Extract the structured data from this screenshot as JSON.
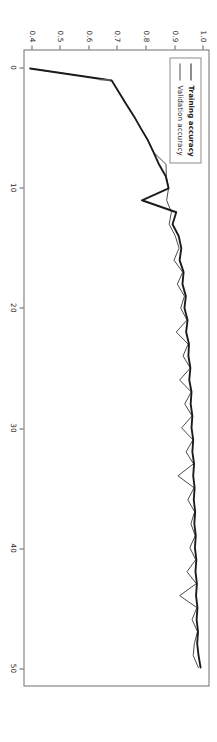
{
  "figure": {
    "rotation_degrees": 90,
    "background_color": "#ffffff",
    "frame_color": "#6f6f6f"
  },
  "legend": {
    "position": "upper left",
    "entries": [
      {
        "label": "Training accuracy",
        "color": "#1b1b1b",
        "style": "thick-solid"
      },
      {
        "label": "Validation accuracy",
        "color": "#4a4a4a",
        "style": "thin-solid"
      }
    ]
  },
  "axes": {
    "xticks": [
      "0",
      "10",
      "20",
      "30",
      "40",
      "50"
    ],
    "yticks": [
      "0.4",
      "0.5",
      "0.6",
      "0.7",
      "0.8",
      "0.9",
      "1.0"
    ]
  },
  "chart_data": {
    "type": "line",
    "title": "",
    "xlabel": "",
    "ylabel": "",
    "xlim": [
      -1.5,
      51.5
    ],
    "ylim": [
      0.37,
      1.02
    ],
    "grid": false,
    "legend_position": "upper left",
    "x": [
      0,
      1,
      2,
      3,
      4,
      5,
      6,
      7,
      8,
      9,
      10,
      11,
      12,
      13,
      14,
      15,
      16,
      17,
      18,
      19,
      20,
      21,
      22,
      23,
      24,
      25,
      26,
      27,
      28,
      29,
      30,
      31,
      32,
      33,
      34,
      35,
      36,
      37,
      38,
      39,
      40,
      41,
      42,
      43,
      44,
      45,
      46,
      47,
      48,
      49,
      50
    ],
    "series": [
      {
        "name": "Training accuracy",
        "color": "#1b1b1b",
        "linewidth": 1.9,
        "values": [
          0.39,
          0.678,
          0.704,
          0.73,
          0.757,
          0.781,
          0.806,
          0.826,
          0.845,
          0.869,
          0.879,
          0.785,
          0.906,
          0.893,
          0.915,
          0.924,
          0.918,
          0.932,
          0.928,
          0.94,
          0.935,
          0.946,
          0.941,
          0.951,
          0.949,
          0.956,
          0.952,
          0.96,
          0.957,
          0.963,
          0.96,
          0.966,
          0.963,
          0.969,
          0.966,
          0.971,
          0.968,
          0.973,
          0.97,
          0.975,
          0.972,
          0.977,
          0.974,
          0.979,
          0.976,
          0.981,
          0.978,
          0.983,
          0.98,
          0.985,
          0.992
        ]
      },
      {
        "name": "Validation accuracy",
        "color": "#4a4a4a",
        "linewidth": 1.0,
        "values": [
          0.39,
          0.678,
          0.704,
          0.73,
          0.757,
          0.781,
          0.806,
          0.826,
          0.87,
          0.871,
          0.879,
          0.872,
          0.889,
          0.881,
          0.903,
          0.916,
          0.898,
          0.929,
          0.91,
          0.935,
          0.922,
          0.944,
          0.906,
          0.948,
          0.93,
          0.956,
          0.918,
          0.959,
          0.936,
          0.962,
          0.925,
          0.965,
          0.941,
          0.967,
          0.912,
          0.969,
          0.947,
          0.971,
          0.958,
          0.973,
          0.954,
          0.975,
          0.944,
          0.977,
          0.918,
          0.979,
          0.962,
          0.981,
          0.97,
          0.966,
          0.984
        ]
      }
    ]
  }
}
